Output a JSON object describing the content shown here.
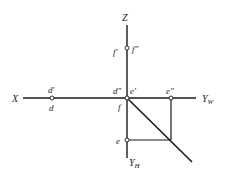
{
  "diagram": {
    "type": "orthographic-projection-axes",
    "colors": {
      "line": "#1a1a1a",
      "text": "#222222",
      "background": "#ffffff"
    },
    "axes": {
      "z": {
        "label": "Z"
      },
      "x": {
        "label": "X"
      },
      "yw": {
        "label": "Y",
        "sub": "W"
      },
      "yh": {
        "label": "Y",
        "sub": "H"
      }
    },
    "points": {
      "f_prime": "f′",
      "f_double": "f″",
      "d_prime": "d′",
      "d": "d",
      "d_double": "d″",
      "e_prime": "e′",
      "f": "f",
      "e_double": "e″",
      "e": "e"
    }
  }
}
